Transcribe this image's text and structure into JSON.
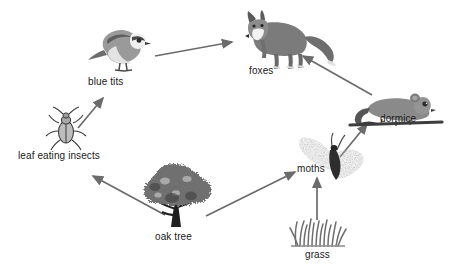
{
  "diagram": {
    "background_color": "#ffffff",
    "arrow_color": "#6b6b6b",
    "label_color": "#1a1a1a",
    "nodes": [
      {
        "id": "blue_tits",
        "label": "blue tits",
        "icon": "blue-tit-bird-icon",
        "label_x": 88,
        "label_y": 76
      },
      {
        "id": "foxes",
        "label": "foxes",
        "icon": "fox-icon",
        "label_x": 249,
        "label_y": 65
      },
      {
        "id": "dormice",
        "label": "dormice",
        "icon": "dormouse-icon",
        "label_x": 380,
        "label_y": 113
      },
      {
        "id": "leaf_eating_insects",
        "label": "leaf eating insects",
        "icon": "beetle-icon",
        "label_x": 18,
        "label_y": 150
      },
      {
        "id": "moths",
        "label": "moths",
        "icon": "moth-icon",
        "label_x": 297,
        "label_y": 163
      },
      {
        "id": "oak_tree",
        "label": "oak tree",
        "icon": "oak-tree-icon",
        "label_x": 155,
        "label_y": 231
      },
      {
        "id": "grass",
        "label": "grass",
        "icon": "grass-tuft-icon",
        "label_x": 305,
        "label_y": 249
      }
    ],
    "arrows": [
      {
        "id": "insects-to-blue-tits",
        "from": "leaf eating insects",
        "to": "blue tits"
      },
      {
        "id": "blue-tits-to-foxes",
        "from": "blue tits",
        "to": "foxes"
      },
      {
        "id": "dormice-to-foxes",
        "from": "dormice",
        "to": "foxes"
      },
      {
        "id": "moths-to-dormice",
        "from": "moths",
        "to": "dormice"
      },
      {
        "id": "oak-tree-to-insects",
        "from": "oak tree",
        "to": "leaf eating insects"
      },
      {
        "id": "oak-tree-to-moths",
        "from": "oak tree",
        "to": "moths"
      },
      {
        "id": "grass-to-moths",
        "from": "grass",
        "to": "moths"
      }
    ]
  }
}
